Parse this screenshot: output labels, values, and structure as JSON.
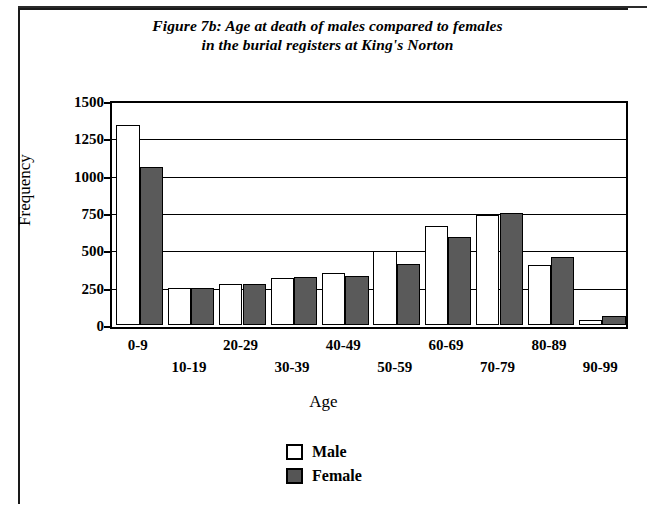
{
  "figure": {
    "title_line1": "Figure 7b: Age at death of males compared to females",
    "title_line2": "in the burial registers at King's Norton"
  },
  "legend": {
    "items": [
      {
        "label": "Male",
        "swatch": "open-white-square",
        "color": "#ffffff"
      },
      {
        "label": "Female",
        "swatch": "filled-gray-square",
        "color": "#555555"
      }
    ]
  },
  "axes": {
    "y_title": "Frequency",
    "x_title": "Age",
    "y_ticks": [
      "1500",
      "1250",
      "1000",
      "750",
      "500",
      "250",
      "0"
    ]
  },
  "chart_data": {
    "type": "bar",
    "title": "Figure 7b: Age at death of males compared to females in the burial registers at King's Norton",
    "xlabel": "Age",
    "ylabel": "Frequency",
    "ylim": [
      0,
      1500
    ],
    "ytick_values": [
      0,
      250,
      500,
      750,
      1000,
      1250,
      1500
    ],
    "grid": true,
    "legend_position": "bottom-center",
    "categories": [
      "0-9",
      "10-19",
      "20-29",
      "30-39",
      "40-49",
      "50-59",
      "60-69",
      "70-79",
      "80-89",
      "90-99"
    ],
    "series": [
      {
        "name": "Male",
        "color": "#ffffff",
        "values": [
          1340,
          250,
          275,
          315,
          345,
          495,
          665,
          735,
          400,
          35
        ]
      },
      {
        "name": "Female",
        "color": "#555555",
        "values": [
          1060,
          245,
          275,
          320,
          325,
          410,
          590,
          750,
          455,
          60
        ]
      }
    ]
  }
}
